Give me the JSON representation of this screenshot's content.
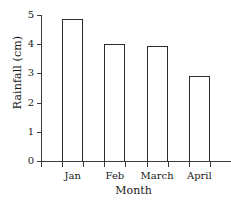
{
  "chart_data": {
    "type": "bar",
    "title": "",
    "subtitle": "",
    "xlabel": "Month",
    "ylabel": "Rainfall (cm)",
    "categories": [
      "Jan",
      "Feb",
      "March",
      "April"
    ],
    "values": [
      4.85,
      4.0,
      3.95,
      2.9
    ],
    "ylim": [
      0,
      5
    ],
    "ytick_labels": [
      "0",
      "1",
      "2",
      "3",
      "4",
      "5"
    ],
    "ytick_values": [
      0,
      1,
      2,
      3,
      4,
      5
    ],
    "grid": false,
    "legend": null,
    "bar_style": {
      "fill": "#ffffff",
      "edge": "#2b2b2b"
    },
    "axis_color": "#3a3a3a"
  }
}
